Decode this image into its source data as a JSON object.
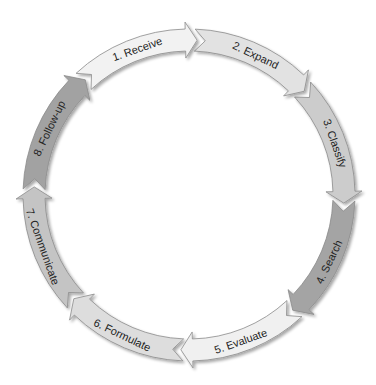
{
  "diagram": {
    "type": "cycle",
    "direction": "clockwise",
    "steps": [
      {
        "label": "1. Receive",
        "color": "#f2f2f2"
      },
      {
        "label": "2. Expand",
        "color": "#e2e2e2"
      },
      {
        "label": "3. Classify",
        "color": "#cccccc"
      },
      {
        "label": "4. Search",
        "color": "#a4a4a4"
      },
      {
        "label": "5. Evaluate",
        "color": "#f0f0f0"
      },
      {
        "label": "6. Formulate",
        "color": "#dddddd"
      },
      {
        "label": "7. Communicate",
        "color": "#c4c4c4"
      },
      {
        "label": "8. Follow-up",
        "color": "#a2a2a2"
      }
    ]
  }
}
